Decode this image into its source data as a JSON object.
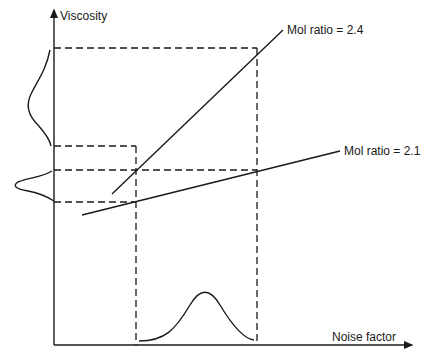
{
  "diagram": {
    "y_axis_label": "Viscosity",
    "x_axis_label": "Noise factor",
    "lines": [
      {
        "label": "Mol ratio = 2.4"
      },
      {
        "label": "Mol ratio = 2.1"
      }
    ],
    "distributions": {
      "input": "noise-factor-distribution",
      "output_2_4": "wide-viscosity-distribution",
      "output_2_1": "narrow-viscosity-distribution"
    }
  }
}
